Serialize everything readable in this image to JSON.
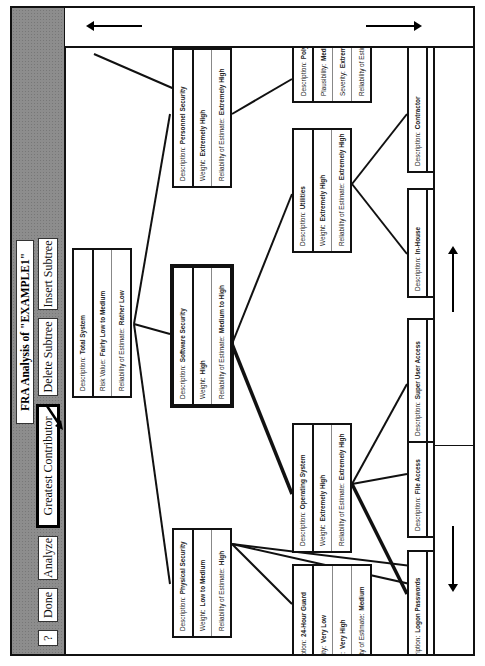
{
  "toolbar": {
    "help_label": "?",
    "done_label": "Done",
    "analyze_label": "Analyze",
    "greatest_contributor_label": "Greatest Contributor",
    "delete_subtree_label": "Delete Subtree",
    "insert_subtree_label": "Insert Subtree",
    "title": "FRA Analysis of \"EXAMPLE1\""
  },
  "tree": {
    "root": {
      "desc_key": "Description:",
      "desc": "Total System",
      "r2_key": "Risk Value:",
      "r2": "Fairly Low to Medium",
      "r3_key": "Reliability of Estimate:",
      "r3": "Rather Low"
    },
    "physical": {
      "desc_key": "Description:",
      "desc": "Physical Security",
      "r2_key": "Weight:",
      "r2": "Low to Medium",
      "r3_key": "Reliability of Estimate:",
      "r3": "High"
    },
    "software": {
      "desc_key": "Description:",
      "desc": "Software Security",
      "r2_key": "Weight:",
      "r2": "High",
      "r3_key": "Reliability of Estimate:",
      "r3": "Medium to High"
    },
    "personal": {
      "desc_key": "Description:",
      "desc": "Personnel Security",
      "r2_key": "Weight:",
      "r2": "Extremely High",
      "r3_key": "Reliability of Estimate:",
      "r3": "Extremely High"
    },
    "guard": {
      "desc_key": "iption:",
      "desc": "24-Hour Guard",
      "r2_key": "ility:",
      "r2": "Very Low",
      "r3_key": "y:",
      "r3": "Very High",
      "r4_key": "lity of Estimate:",
      "r4": "Medium"
    },
    "os": {
      "desc_key": "Description:",
      "desc": "Operating System",
      "r2_key": "Weight:",
      "r2": "Extremely High",
      "r3_key": "Reliability of Estimate:",
      "r3": "Extremely High"
    },
    "utilities": {
      "desc_key": "Description:",
      "desc": "Utilities",
      "r2_key": "Weight:",
      "r2": "Extremely High",
      "r3_key": "Reliability of Estimate:",
      "r3": "Extremely High"
    },
    "polygraph": {
      "desc_key": "Description:",
      "desc": "Polygra",
      "r2_key": "Plausibility:",
      "r2": "Medium",
      "r3_key": "Severity:",
      "r3": "Extremely",
      "r4_key": "Reliability of Estimate",
      "r4": ""
    },
    "logon": {
      "desc_key": "ription:",
      "desc": "Logon Passwords",
      "r2_key": "sibility:",
      "r2": "High to Very High",
      "r3_key": "rity:",
      "r3": "Very High"
    },
    "file": {
      "desc_key": "Description:",
      "desc": "File Access",
      "r2_key": "Plausibility:",
      "r2": "Low",
      "r3_key": "Severity:",
      "r3": "Very High"
    },
    "superuser": {
      "desc_key": "Description:",
      "desc": "Super User Access",
      "r2_key": "Plausibility:",
      "r2": "Very Low",
      "r3_key": "Severity:",
      "r3": "Extremely High"
    },
    "inhouse": {
      "desc_key": "Description:",
      "desc": "In-House",
      "r2_key": "Plausibility:",
      "r2": "Low",
      "r3_key": "Severity:",
      "r3": "High"
    },
    "contractor": {
      "desc_key": "Description:",
      "desc": "Contractor",
      "r2_key": "Plausibility:",
      "r2": "Low to Medium",
      "r3_key": "Severity:",
      "r3": "Very High"
    }
  }
}
